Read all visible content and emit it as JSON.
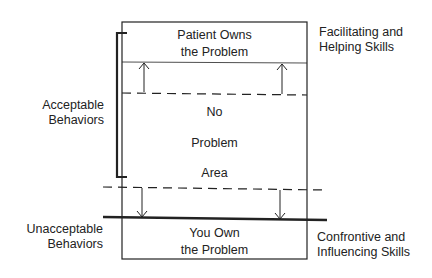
{
  "box": {
    "top_label_line1": "Patient Owns",
    "top_label_line2": "the Problem",
    "mid_no": "No",
    "mid_problem": "Problem",
    "mid_area": "Area",
    "bottom_label_line1": "You Own",
    "bottom_label_line2": "the Problem"
  },
  "left": {
    "acceptable_line1": "Acceptable",
    "acceptable_line2": "Behaviors",
    "unacceptable_line1": "Unacceptable",
    "unacceptable_line2": "Behaviors"
  },
  "right": {
    "facilitating_line1": "Facilitating and",
    "facilitating_line2": "Helping Skills",
    "confrontive_line1": "Confrontive and",
    "confrontive_line2": "Influencing Skills"
  }
}
